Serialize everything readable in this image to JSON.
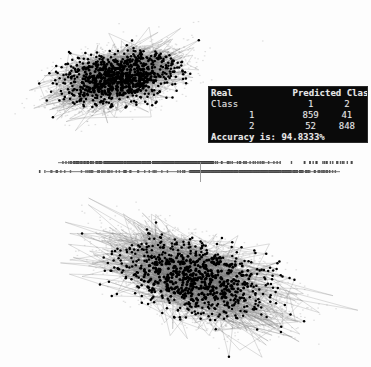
{
  "figure": {
    "background_color": "#ffffff",
    "cluster_fill_color": "#808080",
    "point_color": "#000000",
    "line_color": "#9a9a9a"
  },
  "confusion_panel": {
    "name": "confusion-matrix",
    "background_color": "#0a0a0a",
    "text_color": "#e8e8e8",
    "header_left": "Real",
    "header_right": "Predicted Class",
    "row_label_header": "Class",
    "col_label_1": "1",
    "col_label_2": "2",
    "rows": [
      {
        "label": "1",
        "v1": "859",
        "v2": "41"
      },
      {
        "label": "2",
        "v1": "52",
        "v2": "848"
      }
    ],
    "accuracy_label": "Accuracy is:",
    "accuracy_value": "94.8333%",
    "accuracy_line": "Accuracy is: 94.8333%"
  },
  "chart_data": {
    "type": "scatter",
    "xlabel": "",
    "ylabel": "",
    "grid": false,
    "legend": "none",
    "panels": [
      {
        "name": "top-scatter-class-1",
        "class_label": "1",
        "n_points": 900,
        "center": [
          118,
          78
        ],
        "spread": [
          78,
          34
        ],
        "angle_deg": -14,
        "fill_color": "#808080",
        "point_color": "#000000",
        "has_trajectory_lines": true
      },
      {
        "name": "rug-strip",
        "class_label": "projection",
        "rows": 2,
        "y_top": 161,
        "y_bottom": 170,
        "threshold_x": 200,
        "threshold_y0": 162,
        "threshold_y1": 182,
        "x_min": 38,
        "x_max": 352
      },
      {
        "name": "bottom-scatter-class-2",
        "class_label": "2",
        "n_points": 900,
        "center": [
          196,
          278
        ],
        "spread": [
          112,
          46
        ],
        "angle_deg": 20,
        "fill_color": "#808080",
        "point_color": "#000000",
        "has_trajectory_lines": true
      }
    ],
    "confusion_matrix": {
      "real_classes": [
        "1",
        "2"
      ],
      "predicted_classes": [
        "1",
        "2"
      ],
      "counts": [
        [
          859,
          41
        ],
        [
          52,
          848
        ]
      ],
      "accuracy_percent": 94.8333
    }
  }
}
